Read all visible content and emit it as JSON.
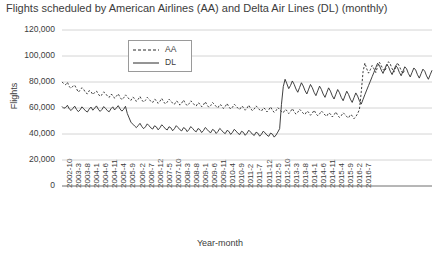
{
  "chart_data": {
    "type": "line",
    "title": "Flights scheduled by American Airlines (AA) and Delta Air Lines (DL) (monthly)",
    "xlabel": "Year-month",
    "ylabel": "Flights",
    "ylim": [
      0,
      120000
    ],
    "ytick_labels": [
      "0",
      "20,000",
      "40,000",
      "60,000",
      "80,000",
      "100,000",
      "120,000"
    ],
    "ytick_values": [
      0,
      20000,
      40000,
      60000,
      80000,
      100000,
      120000
    ],
    "grid": "horizontal",
    "legend_position": "top-left-inside",
    "x_tick_step_months": 5,
    "x_tick_labels": [
      "2002-10",
      "2003-3",
      "2003-8",
      "2004-1",
      "2004-6",
      "2004-11",
      "2005-4",
      "2005-9",
      "2006-2",
      "2006-7",
      "2006-12",
      "2007-5",
      "2007-10",
      "2008-3",
      "2008-8",
      "2009-1",
      "2009-6",
      "2009-11",
      "2010-4",
      "2010-9",
      "2011-2",
      "2011-7",
      "2011-12",
      "2012-5",
      "2012-10",
      "2013-3",
      "2013-8",
      "2014-1",
      "2014-6",
      "2014-11",
      "2015-4",
      "2015-9",
      "2016-2",
      "2016-7"
    ],
    "x_start": "2002-10",
    "x_end": "2016-9",
    "series": [
      {
        "name": "AA",
        "style": "dashed",
        "color": "#2b2b2b",
        "values": [
          80100,
          78600,
          77900,
          79800,
          76400,
          75200,
          76800,
          77500,
          74900,
          72100,
          73800,
          75600,
          74200,
          71800,
          70900,
          73400,
          72600,
          70300,
          71900,
          73100,
          70800,
          68900,
          70200,
          72400,
          71100,
          69300,
          68100,
          70600,
          69800,
          67500,
          69100,
          70900,
          68200,
          66400,
          67800,
          70100,
          68600,
          66900,
          65800,
          68300,
          67400,
          65100,
          66700,
          68900,
          66200,
          64500,
          65900,
          68200,
          66800,
          65100,
          64200,
          66700,
          65900,
          63600,
          65200,
          67400,
          64800,
          63100,
          64500,
          66800,
          65400,
          63700,
          62800,
          65300,
          64500,
          62200,
          63800,
          66100,
          63500,
          61800,
          63200,
          65500,
          64100,
          62400,
          61500,
          64000,
          63200,
          60900,
          62500,
          64800,
          62200,
          60500,
          61900,
          64200,
          62800,
          61100,
          60200,
          62700,
          61900,
          59600,
          61200,
          63500,
          60900,
          59200,
          60600,
          62900,
          61500,
          59800,
          58900,
          61400,
          60600,
          58300,
          59900,
          62200,
          59600,
          57900,
          59300,
          61600,
          60200,
          58500,
          57600,
          60100,
          59300,
          57000,
          58600,
          60900,
          58300,
          56600,
          58000,
          60300,
          58900,
          57200,
          56300,
          58800,
          58000,
          55700,
          57300,
          59600,
          57000,
          55300,
          56700,
          59000,
          57600,
          55900,
          55000,
          57500,
          56700,
          54400,
          56000,
          58300,
          55700,
          54000,
          55400,
          57700,
          56300,
          54600,
          53700,
          56200,
          55400,
          53100,
          54700,
          57000,
          54400,
          52700,
          54100,
          56400,
          55000,
          53300,
          52400,
          54900,
          54100,
          51800,
          53400,
          55700,
          58900,
          72400,
          88100,
          94600,
          90200,
          86800,
          89400,
          92700,
          90100,
          87300,
          91800,
          95200,
          92600,
          89800,
          88400,
          92100,
          95600,
          93800,
          90200,
          87600,
          91300,
          94800,
          92200,
          88900,
          86400,
          89700
        ]
      },
      {
        "name": "DL",
        "style": "solid",
        "color": "#2b2b2b",
        "values": [
          61200,
          59800,
          60400,
          62100,
          59300,
          58100,
          59700,
          61400,
          58900,
          57200,
          58600,
          60900,
          59400,
          57800,
          56900,
          59200,
          60700,
          58300,
          59900,
          61600,
          59100,
          57400,
          58800,
          61100,
          59700,
          58000,
          57100,
          59400,
          60900,
          58500,
          60100,
          61800,
          59300,
          57600,
          59000,
          61300,
          55800,
          52400,
          49100,
          47600,
          46200,
          44900,
          46500,
          48200,
          45800,
          44100,
          45500,
          47800,
          46400,
          44700,
          43800,
          46300,
          45500,
          43200,
          44800,
          47100,
          45700,
          44000,
          43100,
          45600,
          44800,
          42500,
          44100,
          46400,
          45000,
          43300,
          42400,
          44900,
          44100,
          41800,
          43400,
          45700,
          44300,
          42600,
          41700,
          44200,
          43400,
          41100,
          42700,
          45000,
          43600,
          41900,
          41000,
          43500,
          42700,
          40400,
          42000,
          44300,
          42900,
          41200,
          40300,
          42800,
          42000,
          39700,
          41300,
          43600,
          42200,
          40500,
          39600,
          42100,
          41300,
          39000,
          40600,
          42900,
          41500,
          39800,
          38900,
          41400,
          40600,
          38300,
          39900,
          42200,
          40800,
          39100,
          38200,
          40700,
          39900,
          37600,
          39200,
          41500,
          44100,
          62800,
          76400,
          82100,
          78600,
          74900,
          77300,
          80800,
          78200,
          74600,
          72100,
          75800,
          79400,
          76900,
          73300,
          70800,
          74500,
          78100,
          75600,
          72000,
          69500,
          73200,
          76800,
          74300,
          70700,
          68200,
          71900,
          75500,
          73000,
          69400,
          66900,
          70600,
          74200,
          71700,
          68100,
          65600,
          69300,
          72900,
          70400,
          66800,
          64300,
          68000,
          71600,
          69100,
          65500,
          63000,
          66700,
          70300,
          73800,
          77200,
          80600,
          84100,
          87500,
          91000,
          94400,
          92800,
          89200,
          86600,
          90100,
          93500,
          91900,
          88300,
          85700,
          89200,
          92600,
          91000,
          87400,
          84800,
          88300,
          91700,
          90100,
          86500,
          83900,
          87400,
          90800,
          89200,
          85600,
          83000,
          86500,
          89900,
          88300,
          84700,
          82100,
          85600,
          89000
        ]
      }
    ]
  }
}
